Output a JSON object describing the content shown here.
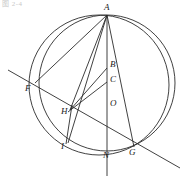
{
  "figure": {
    "caption": "图 2-4",
    "type": "geometry-diagram",
    "stroke_color": "#2b2b2b",
    "background_color": "#ffffff",
    "width": 186,
    "height": 183
  },
  "points": [
    {
      "label": "A",
      "x": 107,
      "y": 15,
      "label_x": 104,
      "label_y": 3
    },
    {
      "label": "B",
      "x": 107,
      "y": 68,
      "label_x": 110,
      "label_y": 60
    },
    {
      "label": "C",
      "x": 107,
      "y": 82,
      "label_x": 110,
      "label_y": 75
    },
    {
      "label": "O",
      "x": 107,
      "y": 107,
      "label_x": 110,
      "label_y": 99
    },
    {
      "label": "F",
      "x": 35,
      "y": 83,
      "label_x": 25,
      "label_y": 84
    },
    {
      "label": "H",
      "x": 70,
      "y": 110,
      "label_x": 61,
      "label_y": 107
    },
    {
      "label": "I",
      "x": 68,
      "y": 143,
      "label_x": 61,
      "label_y": 142
    },
    {
      "label": "N",
      "x": 107,
      "y": 152,
      "label_x": 104,
      "label_y": 151
    },
    {
      "label": "G",
      "x": 134,
      "y": 147,
      "label_x": 129,
      "label_y": 149
    }
  ],
  "circles": [
    {
      "name": "outer-circle",
      "cx": 99,
      "cy": 85,
      "r": 70
    },
    {
      "name": "inner-circle",
      "cx": 107,
      "cy": 83,
      "r": 68
    }
  ],
  "segments": [
    {
      "name": "segment-A-F",
      "from": "A",
      "to": "F"
    },
    {
      "name": "segment-A-H",
      "from": "A",
      "to": "H"
    },
    {
      "name": "segment-A-I",
      "from": "A",
      "to": "I"
    },
    {
      "name": "segment-A-G",
      "from": "A",
      "to": "G"
    },
    {
      "name": "segment-A-N",
      "from": "A",
      "to": "N"
    },
    {
      "name": "segment-B-H",
      "from": "B",
      "to": "H"
    },
    {
      "name": "segment-C-H",
      "from": "C",
      "to": "H"
    },
    {
      "name": "secant-F-G",
      "from": "F",
      "to": "G"
    },
    {
      "name": "vertical-axis",
      "from": "A",
      "to": "below-N"
    }
  ]
}
